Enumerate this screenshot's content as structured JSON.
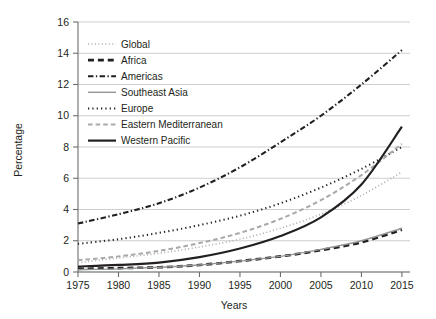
{
  "chart_data": {
    "type": "line",
    "title": "",
    "xlabel": "Years",
    "ylabel": "Percentage",
    "xlim": [
      1975,
      2016
    ],
    "ylim": [
      0,
      16
    ],
    "grid": true,
    "legend_position": "upper-left-inside",
    "x": [
      1975,
      1980,
      1985,
      1990,
      1995,
      2000,
      2005,
      2010,
      2015
    ],
    "xticks": [
      "1975",
      "1980",
      "1985",
      "1990",
      "1995",
      "2000",
      "2005",
      "2010",
      "2015"
    ],
    "yticks": [
      "0",
      "2",
      "4",
      "6",
      "8",
      "10",
      "12",
      "14",
      "16"
    ],
    "series": [
      {
        "name": "Global",
        "style": "dotted",
        "color": "#a7a9ac",
        "width": 1.6,
        "values": [
          0.6,
          0.9,
          1.2,
          1.6,
          2.1,
          2.8,
          3.7,
          4.9,
          6.4
        ]
      },
      {
        "name": "Africa",
        "style": "dashed",
        "color": "#231f20",
        "width": 2.6,
        "values": [
          0.2,
          0.25,
          0.3,
          0.45,
          0.7,
          1.0,
          1.4,
          1.9,
          2.7
        ]
      },
      {
        "name": "Americas",
        "style": "dash-dot",
        "color": "#231f20",
        "width": 2.1,
        "values": [
          3.1,
          3.7,
          4.4,
          5.4,
          6.7,
          8.3,
          10.0,
          12.0,
          14.2
        ]
      },
      {
        "name": "Southeast Asia",
        "style": "solid",
        "color": "#939598",
        "width": 1.4,
        "values": [
          0.15,
          0.2,
          0.3,
          0.45,
          0.7,
          1.0,
          1.45,
          2.0,
          2.8
        ]
      },
      {
        "name": "Europe",
        "style": "dotted",
        "color": "#231f20",
        "width": 2.0,
        "values": [
          1.8,
          2.1,
          2.5,
          3.0,
          3.6,
          4.4,
          5.4,
          6.6,
          8.0
        ]
      },
      {
        "name": "Eastern Mediterranean",
        "style": "dashed",
        "color": "#a7a9ac",
        "width": 2.0,
        "values": [
          0.75,
          1.0,
          1.35,
          1.85,
          2.5,
          3.4,
          4.6,
          6.2,
          8.2
        ]
      },
      {
        "name": "Western Pacific",
        "style": "solid",
        "color": "#231f20",
        "width": 2.2,
        "values": [
          0.35,
          0.45,
          0.6,
          0.95,
          1.5,
          2.3,
          3.5,
          5.6,
          9.3
        ]
      }
    ]
  },
  "axes": {
    "y_title": "Percentage",
    "x_title": "Years"
  },
  "legend": {
    "items": [
      {
        "label": "Global"
      },
      {
        "label": "Africa"
      },
      {
        "label": "Americas"
      },
      {
        "label": "Southeast Asia"
      },
      {
        "label": "Europe"
      },
      {
        "label": "Eastern Mediterranean"
      },
      {
        "label": "Western Pacific"
      }
    ]
  }
}
